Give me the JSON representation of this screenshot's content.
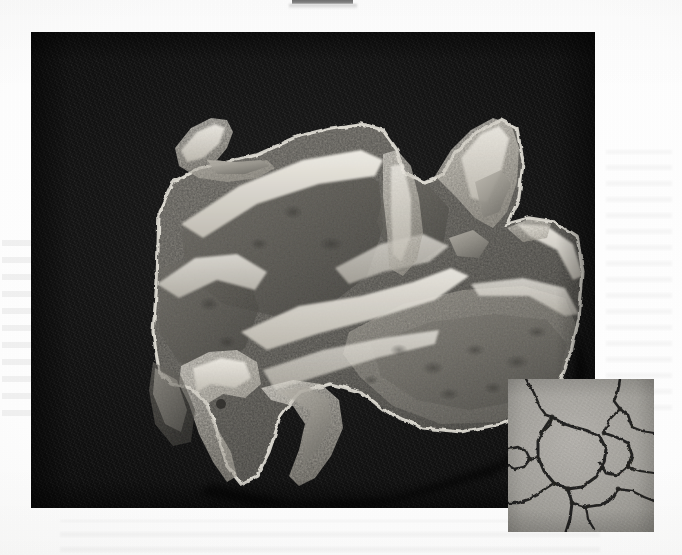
{
  "page": {
    "kind": "scanned-journal-figure-page",
    "width": 682,
    "height": 555,
    "paper_color": "#fdfdfd",
    "ink_color": "#151515"
  },
  "top_crop_mark": {
    "description": "cropped dark remnant of text line from the page region above",
    "x": 292,
    "y": 0,
    "width": 61,
    "height": 4,
    "color": "#5c5c5c"
  },
  "main_plate": {
    "name": "specimen-photograph",
    "description": "photomicrograph of a fossil bone / skull fragment on a black background",
    "x": 31,
    "y": 32,
    "width": 564,
    "height": 476,
    "background_color": "#151515",
    "specimen_tone_light": "#e8e5dd",
    "specimen_tone_mid": "#9d9a92",
    "specimen_tone_dark": "#55534e"
  },
  "inset_plate": {
    "name": "detail-inset-micrograph",
    "description": "higher magnification detail showing polygonal grain boundaries",
    "x": 508,
    "y": 379,
    "width": 146,
    "height": 153,
    "background_color": "#a8a6a2",
    "boundary_color": "#2b2a27"
  },
  "ghost_text": {
    "description": "faint show-through of text printed on the reverse of the sheet",
    "left_margin": true,
    "right_margin": true,
    "bottom_margin": true,
    "opacity": 0.05
  },
  "labels": {
    "caption": "",
    "figure_number": "",
    "scale_bar": ""
  }
}
